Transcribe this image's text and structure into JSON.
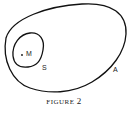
{
  "diagram": {
    "sets": [
      {
        "label": "A",
        "role": "outer-set"
      },
      {
        "label": "S",
        "role": "inner-set"
      }
    ],
    "point": {
      "label": "M"
    },
    "caption": {
      "word": "FIGURE",
      "number": "2"
    }
  },
  "colors": {
    "stroke": "#111111",
    "background": "#ffffff"
  }
}
